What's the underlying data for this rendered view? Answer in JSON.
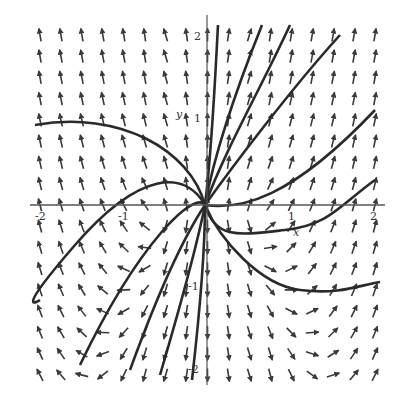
{
  "figure": {
    "type": "direction_field_phase_portrait",
    "axes": {
      "x_label": "x",
      "y_label": "y",
      "x_range": [
        -2,
        2
      ],
      "y_range": [
        -2,
        2
      ],
      "x_ticks": [
        "-2",
        "-1",
        "1",
        "2"
      ],
      "y_ticks": [
        "2",
        "1",
        "-1",
        "-2"
      ]
    },
    "colors": {
      "arrows": "#3a3a3a",
      "curves": "#2a2a2a",
      "axes": "#555555",
      "background": "#ffffff"
    },
    "grid": {
      "nx": 17,
      "ny": 17
    },
    "curves": [
      "M 205 205 C 190 150, 120 110, 35 125",
      "M 205 205 C 185 170, 140 170, 75 245 S 40 300, 40 300",
      "M 205 205 C 195 190, 140 240, 80 365",
      "M 205 205 C 195 220, 170 260, 130 370",
      "M 205 205 C 200 230, 185 290, 160 375",
      "M 205 205 C 205 240, 200 310, 192 380",
      "M 205 205 C 212 150, 215 80, 218 25",
      "M 205 205 C 215 150, 240 80, 262 25",
      "M 205 205 C 225 150, 260 90, 290 25",
      "M 205 205 C 230 170, 290 90, 340 35",
      "M 205 205 C 240 210, 290 200, 375 110",
      "M 205 205 C 215 240, 240 235, 285 230 S 340 205, 375 180",
      "M 205 205 C 220 240, 260 285, 300 290 S 360 285, 380 282"
    ]
  }
}
